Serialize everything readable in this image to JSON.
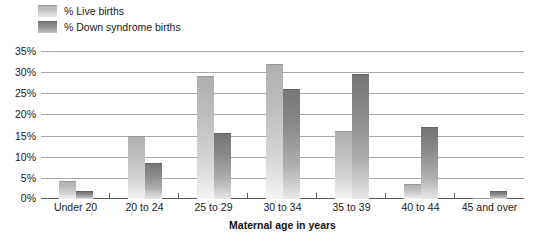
{
  "chart_data": {
    "type": "bar",
    "title": "",
    "subtitle": "",
    "xlabel": "Maternal age in years",
    "ylabel": "",
    "categories": [
      "Under 20",
      "20 to 24",
      "25 to 29",
      "30 to 34",
      "35 to 39",
      "40 to 44",
      "45 and over"
    ],
    "series": [
      {
        "name": "% Live births",
        "values": [
          4.3,
          15.0,
          29.0,
          32.0,
          16.0,
          3.5,
          0.3
        ]
      },
      {
        "name": "% Down syndrome births",
        "values": [
          2.0,
          8.5,
          15.5,
          26.0,
          29.5,
          17.0,
          2.0
        ]
      }
    ],
    "ylim": [
      0,
      35
    ],
    "ytick_values": [
      0,
      5,
      10,
      15,
      20,
      25,
      30,
      35
    ],
    "ytick_labels": [
      "0%",
      "5%",
      "10%",
      "15%",
      "20%",
      "25%",
      "30%",
      "35%"
    ],
    "grid": true,
    "legend_position": "top-left",
    "colors": {
      "series1_top": "#b0b0b0",
      "series1_bottom": "#f4f4f4",
      "series2_top": "#767676",
      "series2_bottom": "#e8e8e8",
      "gridline": "#a9a9a9",
      "axis": "#5a5a5a",
      "text": "#1a1a1a",
      "background": "#ffffff"
    }
  }
}
